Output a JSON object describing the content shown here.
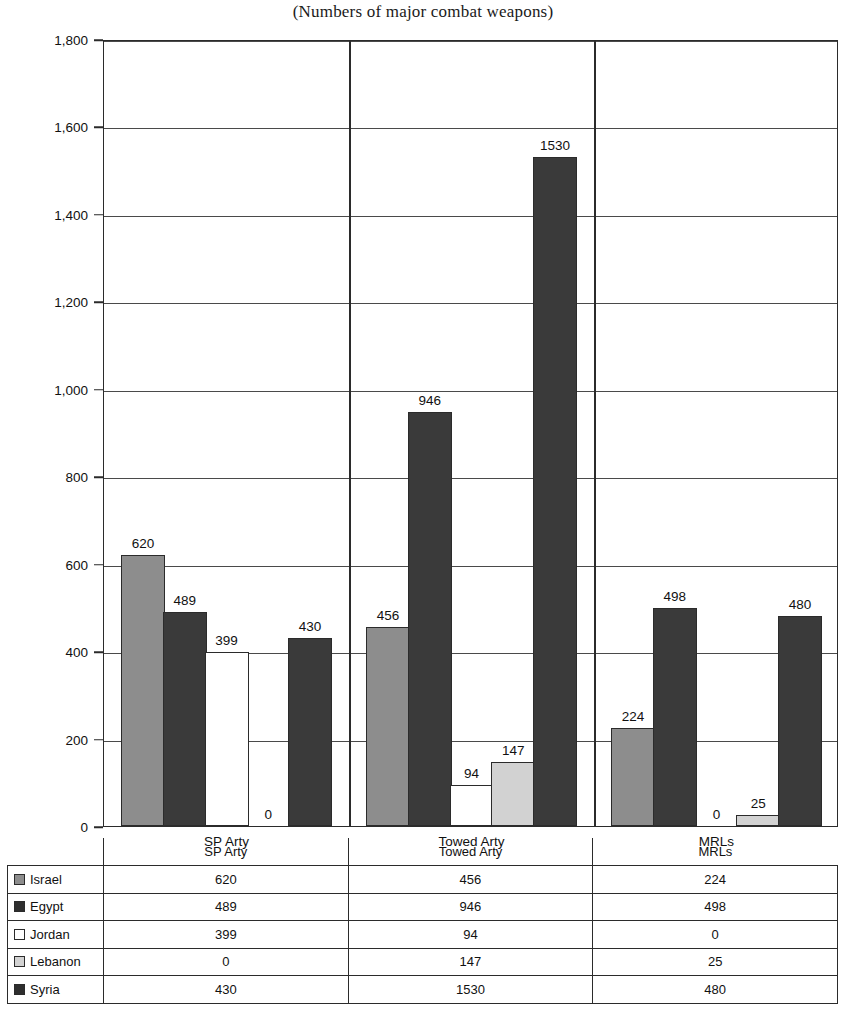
{
  "chart_data": {
    "type": "bar",
    "title": "(Numbers of major combat weapons)",
    "xlabel": "",
    "ylabel": "",
    "ylim": [
      0,
      1800
    ],
    "grid": true,
    "legend_position": "table-below",
    "categories": [
      "SP Arty",
      "Towed Arty",
      "MRLs"
    ],
    "ytick_labels": [
      "0",
      "200",
      "400",
      "600",
      "800",
      "1,000",
      "1,200",
      "1,400",
      "1,600",
      "1,800"
    ],
    "ytick_values": [
      0,
      200,
      400,
      600,
      800,
      1000,
      1200,
      1400,
      1600,
      1800
    ],
    "series": [
      {
        "name": "Israel",
        "color": "#8d8d8d",
        "values": [
          620,
          456,
          224
        ]
      },
      {
        "name": "Egypt",
        "color": "#3a3a3a",
        "values": [
          489,
          946,
          498
        ]
      },
      {
        "name": "Jordan",
        "color": "#ffffff",
        "values": [
          399,
          94,
          0
        ]
      },
      {
        "name": "Lebanon",
        "color": "#d2d2d2",
        "values": [
          0,
          147,
          25
        ]
      },
      {
        "name": "Syria",
        "color": "#3a3a3a",
        "values": [
          430,
          1530,
          480
        ]
      }
    ],
    "bar_labels": [
      [
        "620",
        "489",
        "399",
        "0",
        "430"
      ],
      [
        "456",
        "946",
        "94",
        "147",
        "1530"
      ],
      [
        "224",
        "498",
        "0",
        "25",
        "480"
      ]
    ]
  },
  "table": {
    "corner_header": "",
    "column_headers": [
      "SP Arty",
      "Towed Arty",
      "MRLs"
    ],
    "rows": [
      {
        "label": "Israel",
        "swatch": "israel",
        "values": [
          "620",
          "456",
          "224"
        ]
      },
      {
        "label": "Egypt",
        "swatch": "egypt",
        "values": [
          "489",
          "946",
          "498"
        ]
      },
      {
        "label": "Jordan",
        "swatch": "jordan",
        "values": [
          "399",
          "94",
          "0"
        ]
      },
      {
        "label": "Lebanon",
        "swatch": "lebanon",
        "values": [
          "0",
          "147",
          "25"
        ]
      },
      {
        "label": "Syria",
        "swatch": "syria",
        "values": [
          "430",
          "1530",
          "480"
        ]
      }
    ]
  }
}
